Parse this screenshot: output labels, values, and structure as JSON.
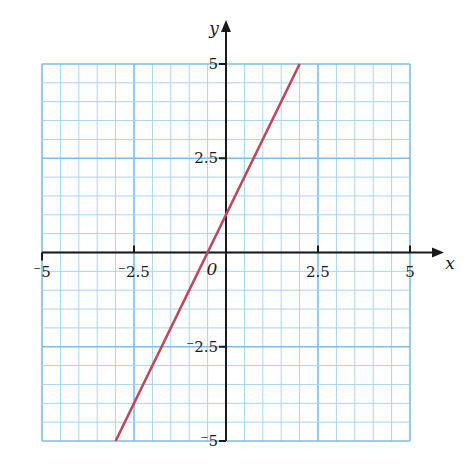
{
  "chart_data": {
    "type": "line",
    "title": "",
    "xlabel": "x",
    "ylabel": "y",
    "xlim": [
      -5,
      5
    ],
    "ylim": [
      -5,
      5
    ],
    "grid": true,
    "grid_minor_step": 0.5,
    "grid_major_step": 2.5,
    "x_ticks": [
      -5,
      -2.5,
      0,
      2.5,
      5
    ],
    "x_tick_labels": [
      "⁻5",
      "⁻2.5",
      "",
      "2.5",
      "5"
    ],
    "y_ticks": [
      -5,
      -2.5,
      2.5,
      5
    ],
    "y_tick_labels": [
      "⁻5",
      "⁻2.5",
      "2.5",
      "5"
    ],
    "origin_label": "0",
    "series": [
      {
        "name": "y = 2x + 1",
        "x": [
          -3,
          -0.5,
          0,
          2
        ],
        "y": [
          -5,
          0,
          1,
          5
        ],
        "color": "#c0475a"
      }
    ],
    "colors": {
      "grid_minor": "#a9d4ef",
      "grid_major": "#7fbde6",
      "axis": "#1a1a1a",
      "line": "#c0475a"
    }
  }
}
